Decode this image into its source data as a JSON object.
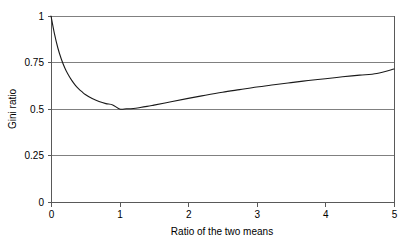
{
  "chart_data": {
    "type": "line",
    "title": "",
    "xlabel": "Ratio of the two means",
    "ylabel": "Gini ratio",
    "xlim": [
      0,
      5
    ],
    "ylim": [
      0,
      1
    ],
    "grid": "horizontal",
    "legend": "none",
    "xticks": [
      "0",
      "1",
      "2",
      "3",
      "4",
      "5"
    ],
    "xtick_values": [
      0,
      1,
      2,
      3,
      4,
      5
    ],
    "yticks": [
      "0",
      "0.25",
      "0.5",
      "0.75",
      "1"
    ],
    "ytick_values": [
      0,
      0.25,
      0.5,
      0.75,
      1
    ],
    "gridline_values": [
      0.25,
      0.5,
      0.75,
      1
    ],
    "series": [
      {
        "name": "Gini ratio vs ratio of the two means",
        "color": "#1a1a1a",
        "x": [
          0.0,
          0.05,
          0.1,
          0.15,
          0.2,
          0.25,
          0.3,
          0.35,
          0.4,
          0.45,
          0.5,
          0.6,
          0.7,
          0.8,
          0.9,
          1.0,
          1.1,
          1.2,
          1.3,
          1.4,
          1.5,
          1.75,
          2.0,
          2.25,
          2.5,
          2.75,
          3.0,
          3.25,
          3.5,
          3.75,
          4.0,
          4.25,
          4.5,
          4.75,
          5.0
        ],
        "y": [
          1.0,
          0.905,
          0.828,
          0.769,
          0.722,
          0.685,
          0.655,
          0.63,
          0.61,
          0.593,
          0.578,
          0.556,
          0.54,
          0.529,
          0.522,
          0.5,
          0.501,
          0.503,
          0.508,
          0.514,
          0.521,
          0.539,
          0.557,
          0.574,
          0.59,
          0.604,
          0.618,
          0.63,
          0.642,
          0.653,
          0.663,
          0.673,
          0.682,
          0.691,
          0.715
        ]
      }
    ]
  },
  "layout": {
    "plot_left": 51,
    "plot_right": 394,
    "plot_top": 16,
    "plot_bottom": 202
  }
}
